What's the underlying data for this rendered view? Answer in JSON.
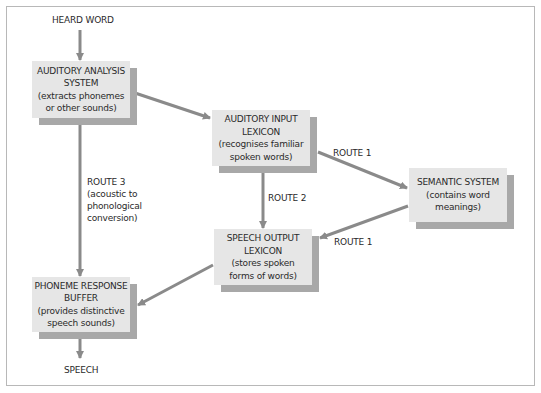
{
  "diagram": {
    "colors": {
      "box_fill": "#e6e6e6",
      "box_shadow": "#a8a8a8",
      "arrow": "#8a8a8a",
      "frame": "#b8b8b8"
    },
    "input_label": "HEARD WORD",
    "output_label": "SPEECH",
    "boxes": {
      "auditory_analysis": {
        "title1": "AUDITORY ANALYSIS",
        "title2": "SYSTEM",
        "desc1": "(extracts phonemes",
        "desc2": "or other sounds)"
      },
      "auditory_input_lexicon": {
        "title1": "AUDITORY INPUT",
        "title2": "LEXICON",
        "desc1": "(recognises familiar",
        "desc2": "spoken words)"
      },
      "semantic_system": {
        "title1": "SEMANTIC SYSTEM",
        "desc1": "(contains word",
        "desc2": "meanings)"
      },
      "speech_output_lexicon": {
        "title1": "SPEECH OUTPUT",
        "title2": "LEXICON",
        "desc1": "(stores spoken",
        "desc2": "forms of words)"
      },
      "phoneme_response_buffer": {
        "title1": "PHONEME RESPONSE",
        "title2": "BUFFER",
        "desc1": "(provides distinctive",
        "desc2": "speech sounds)"
      }
    },
    "routes": {
      "route1_a": "ROUTE 1",
      "route1_b": "ROUTE 1",
      "route2": "ROUTE 2",
      "route3_l1": "ROUTE 3",
      "route3_l2": "(acoustic to",
      "route3_l3": "phonological",
      "route3_l4": "conversion)"
    }
  }
}
